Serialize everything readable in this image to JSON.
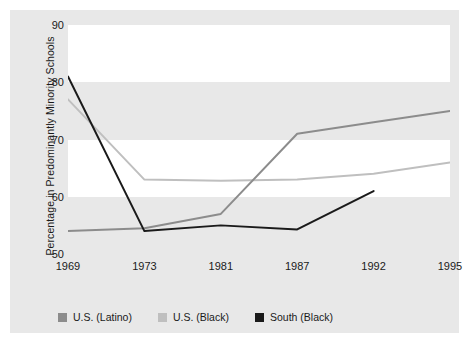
{
  "chart_data": {
    "type": "line",
    "title": "",
    "subtitle": "",
    "xlabel": "",
    "ylabel": "Percentage in Predominantly Minority Schools",
    "x": [
      "1969",
      "1973",
      "1981",
      "1987",
      "1992",
      "1995"
    ],
    "categories": [
      "1969",
      "1973",
      "1981",
      "1987",
      "1992",
      "1995"
    ],
    "xlim": [
      1967,
      1997
    ],
    "ylim": [
      50,
      90
    ],
    "yticks": [
      50,
      60,
      70,
      80,
      90
    ],
    "ytick_labels": [
      "50",
      "60",
      "70",
      "80",
      "90"
    ],
    "grid": false,
    "banded_background": true,
    "legend_position": "bottom",
    "series": [
      {
        "name": "U.S. (Latino)",
        "color": "#8c8c8c",
        "x": [
          "1969",
          "1973",
          "1981",
          "1987",
          "1992",
          "1995"
        ],
        "values": [
          54,
          54.5,
          57,
          71,
          73,
          75
        ]
      },
      {
        "name": "U.S. (Black)",
        "color": "#bfbfbf",
        "x": [
          "1969",
          "1973",
          "1981",
          "1987",
          "1992",
          "1995"
        ],
        "values": [
          77,
          63,
          62.8,
          63,
          64,
          66
        ]
      },
      {
        "name": "South (Black)",
        "color": "#1a1a1a",
        "x": [
          "1969",
          "1973",
          "1981",
          "1987",
          "1992"
        ],
        "values": [
          81,
          54,
          55,
          54.3,
          61
        ]
      }
    ]
  },
  "legend": {
    "items": [
      {
        "label": "U.S. (Latino)",
        "color": "#8c8c8c"
      },
      {
        "label": "U.S. (Black)",
        "color": "#bfbfbf"
      },
      {
        "label": "South (Black)",
        "color": "#1a1a1a"
      }
    ]
  },
  "colors": {
    "panel_background": "#e8e8e8",
    "band_background": "#ffffff",
    "text": "#1a1a1a",
    "latino": "#8c8c8c",
    "black_us": "#bfbfbf",
    "south_black": "#1a1a1a"
  }
}
